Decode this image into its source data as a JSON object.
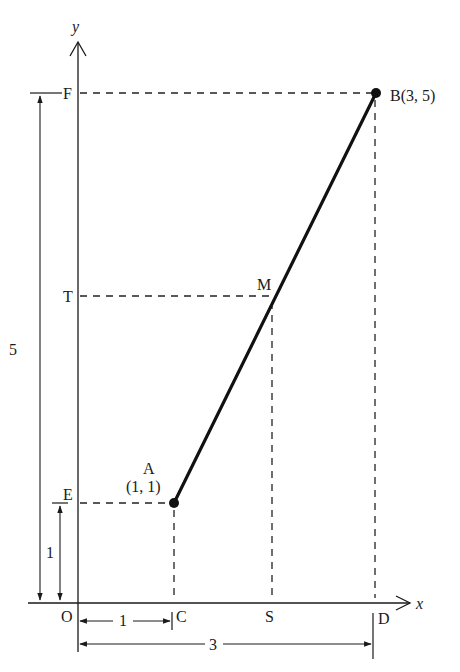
{
  "diagram": {
    "axes": {
      "x_label": "x",
      "y_label": "y",
      "origin_label": "O"
    },
    "points": {
      "A": {
        "name": "A",
        "coords": "(1, 1)",
        "x": 1,
        "y": 1
      },
      "B": {
        "name": "B",
        "label": "B(3, 5)",
        "x": 3,
        "y": 5
      },
      "M": {
        "name": "M"
      }
    },
    "axis_points": {
      "x_axis": [
        "C",
        "S",
        "D"
      ],
      "y_axis": [
        "E",
        "T",
        "F"
      ],
      "C": "C",
      "S": "S",
      "D": "D",
      "E": "E",
      "T": "T",
      "F": "F"
    },
    "dimensions": {
      "vertical_total": "5",
      "vertical_unit": "1",
      "horizontal_unit": "1",
      "horizontal_total": "3"
    },
    "colors": {
      "ink": "#1a1a1a",
      "background": "#ffffff"
    }
  }
}
